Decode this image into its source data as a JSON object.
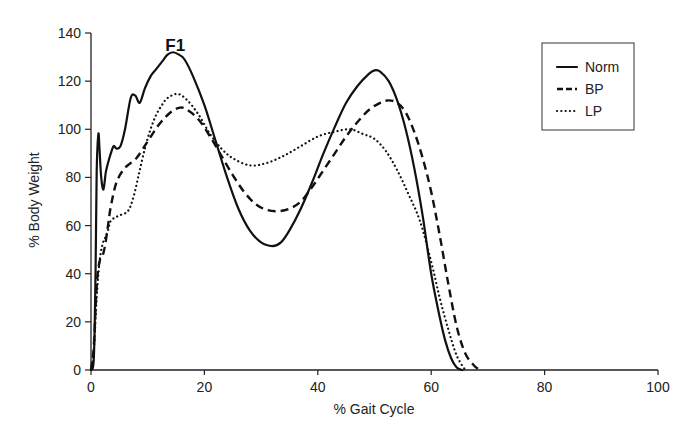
{
  "chart_data": {
    "type": "line",
    "title": "",
    "xlabel": "% Gait Cycle",
    "ylabel": "% Body Weight",
    "xlim": [
      0,
      100
    ],
    "ylim": [
      0,
      140
    ],
    "xticks": [
      0,
      20,
      40,
      60,
      80,
      100
    ],
    "yticks": [
      0,
      20,
      40,
      60,
      80,
      100,
      120,
      140
    ],
    "grid": false,
    "legend_position": "upper right",
    "annotations": [
      {
        "text": "F1",
        "x": 14.5,
        "y": 135
      }
    ],
    "series": [
      {
        "name": "Norm",
        "style": "solid",
        "x": [
          0,
          0.5,
          0.8,
          1.0,
          1.3,
          1.5,
          1.8,
          2.2,
          2.6,
          3.0,
          3.5,
          4.0,
          4.5,
          5.2,
          6.0,
          7.0,
          7.8,
          8.6,
          9.5,
          10.5,
          11.5,
          12.5,
          13.5,
          14.5,
          15.5,
          16.5,
          18,
          20,
          22,
          24,
          26,
          28,
          30,
          32,
          33.5,
          35,
          37,
          39,
          41,
          43,
          45,
          47,
          49,
          50,
          51,
          52.5,
          54,
          55.5,
          57,
          58.5,
          60,
          61.5,
          62.5,
          63.5,
          64.5,
          65.5
        ],
        "values": [
          0,
          5,
          40,
          82,
          98,
          92,
          80,
          75,
          82,
          86,
          90,
          93,
          92,
          93,
          100,
          113,
          114,
          111,
          117,
          122,
          125,
          128,
          131,
          132,
          131,
          129,
          122,
          110,
          95,
          80,
          67,
          58,
          53,
          51.5,
          53,
          58,
          67,
          78,
          90,
          101,
          111,
          118,
          123,
          124.5,
          124,
          120,
          112,
          100,
          84,
          64,
          40,
          22,
          12,
          5,
          1,
          0
        ]
      },
      {
        "name": "BP",
        "style": "dashed",
        "x": [
          0,
          0.5,
          1.0,
          1.5,
          2.0,
          2.5,
          3.0,
          3.5,
          4.5,
          6,
          8,
          10,
          12,
          14,
          15.7,
          17,
          19,
          21,
          23,
          25,
          27,
          29,
          31,
          33,
          35,
          37,
          39,
          41,
          43,
          45,
          47,
          49,
          51,
          52.5,
          54,
          55.5,
          57,
          58.5,
          60,
          61.5,
          63,
          64.5,
          66,
          67.5,
          68.6
        ],
        "values": [
          0,
          10,
          35,
          45,
          47,
          52,
          60,
          68,
          78,
          84,
          88,
          95,
          102,
          107,
          109,
          108,
          104,
          97,
          89,
          81,
          74,
          69,
          66.5,
          66,
          67,
          70,
          76,
          83,
          90,
          97,
          103,
          108,
          111,
          112,
          111,
          107,
          99,
          88,
          74,
          56,
          36,
          18,
          7,
          2,
          0
        ]
      },
      {
        "name": "LP",
        "style": "dotted",
        "x": [
          0,
          0.5,
          1.0,
          1.5,
          2.0,
          2.5,
          3.0,
          3.5,
          4.8,
          6.5,
          7.5,
          8.5,
          9.5,
          10.5,
          11.5,
          12.5,
          13.5,
          15.3,
          17,
          19,
          21,
          23,
          25,
          28,
          31,
          34,
          37,
          40,
          43,
          45.7,
          48,
          50,
          52,
          54,
          56,
          58,
          60,
          61.5,
          63,
          64.5,
          66
        ],
        "values": [
          0,
          8,
          30,
          45,
          52,
          55,
          58,
          62,
          64,
          66,
          72,
          82,
          92,
          100,
          106,
          110,
          113,
          114.7,
          112,
          106,
          98,
          92,
          88,
          85,
          86,
          89,
          93,
          97,
          99,
          100,
          98,
          96,
          91,
          83,
          73,
          62,
          45,
          30,
          17,
          6,
          0
        ]
      }
    ]
  },
  "cropped_top_text": "…g…"
}
